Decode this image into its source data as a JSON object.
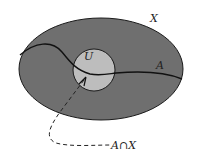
{
  "diagram": {
    "labels": {
      "set_x": "X",
      "set_u": "U",
      "curve_a": "A",
      "intersection": "A∩X"
    },
    "colors": {
      "ellipse_fill": "#6f6f6f",
      "circle_fill": "#bdbdbd",
      "stroke": "#1a1a1a",
      "background": "#ffffff"
    }
  }
}
